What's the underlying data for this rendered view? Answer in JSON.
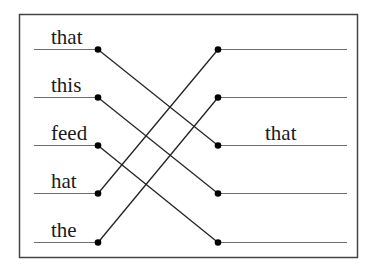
{
  "diagram": {
    "left_words": [
      "that",
      "this",
      "feed",
      "hat",
      "the"
    ],
    "right_labels": [
      "",
      "",
      "that",
      "",
      ""
    ],
    "connections": [
      {
        "from": 0,
        "to": 2
      },
      {
        "from": 1,
        "to": 3
      },
      {
        "from": 2,
        "to": 4
      },
      {
        "from": 3,
        "to": 0
      },
      {
        "from": 4,
        "to": 1
      }
    ],
    "colors": {
      "line": "#222222",
      "rule": "#6e6e6e",
      "border": "#444444",
      "dot": "#000000"
    }
  }
}
